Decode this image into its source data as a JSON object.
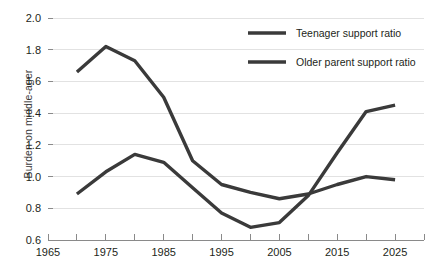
{
  "chart_data": {
    "type": "line",
    "title": "",
    "xlabel": "",
    "ylabel": "Burden on middle-ager",
    "xlim": [
      1965,
      2030
    ],
    "ylim": [
      0.6,
      2.0
    ],
    "grid": "horizontal",
    "legend_position": "top-right",
    "x": [
      1970,
      1975,
      1980,
      1985,
      1990,
      1995,
      2000,
      2005,
      2010,
      2015,
      2020,
      2025
    ],
    "xticks": [
      1965,
      1970,
      1975,
      1980,
      1985,
      1990,
      1995,
      2000,
      2005,
      2010,
      2015,
      2020,
      2025,
      2030
    ],
    "xtick_labels": [
      "1965",
      "",
      "1975",
      "",
      "1985",
      "",
      "1995",
      "",
      "2005",
      "",
      "2015",
      "",
      "2025",
      ""
    ],
    "yticks": [
      0.6,
      0.8,
      1.0,
      1.2,
      1.4,
      1.6,
      1.8,
      2.0
    ],
    "ytick_labels": [
      "0.6",
      "0.8",
      "1.0",
      "1.2",
      "1.4",
      "1.6",
      "1.8",
      "2.0"
    ],
    "series": [
      {
        "name": "Teenager support ratio",
        "color": "#3a3a3a",
        "values": [
          1.66,
          1.82,
          1.73,
          1.5,
          1.1,
          0.95,
          0.9,
          0.86,
          0.89,
          0.95,
          1.0,
          0.98
        ]
      },
      {
        "name": "Older parent support ratio",
        "color": "#3a3a3a",
        "values": [
          0.89,
          1.03,
          1.14,
          1.09,
          0.93,
          0.77,
          0.68,
          0.71,
          0.88,
          1.15,
          1.41,
          1.45
        ]
      }
    ]
  },
  "legend": {
    "items": [
      {
        "label": "Teenager support ratio",
        "color": "#3a3a3a"
      },
      {
        "label": "Older parent support ratio",
        "color": "#3a3a3a"
      }
    ]
  },
  "colors": {
    "line": "#3a3a3a",
    "grid": "#e2e2e2",
    "axis": "#8a8a8a",
    "text": "#231f20",
    "background": "#ffffff"
  }
}
